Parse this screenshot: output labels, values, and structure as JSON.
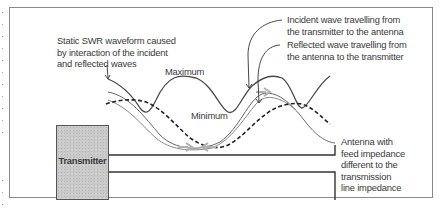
{
  "diagram": {
    "labels": {
      "static_swr": [
        "Static SWR waveform caused",
        "by interaction of the incident",
        "and reflected waves"
      ],
      "incident": [
        "Incident wave travelling from",
        "the transmitter to the antenna"
      ],
      "reflected": [
        "Reflected wave travelling from",
        "the antenna to the transmitter"
      ],
      "maximum": "Maximum",
      "minimum": "Minimum",
      "antenna": [
        "Antenna with",
        "feed impedance",
        "different to the",
        "transmission",
        "line impedance"
      ]
    },
    "transmitter_label": "Transmitter",
    "colors": {
      "frame": "#8a8a8a",
      "swr_curve": "#4a4a4a",
      "incident_curve": "#555555",
      "reflected_curve": "#777777",
      "dashed_curve": "#222222",
      "arrow_gray": "#b0b0b0",
      "transmitter_fill": "#c9c9c9",
      "line": "#333333"
    }
  }
}
